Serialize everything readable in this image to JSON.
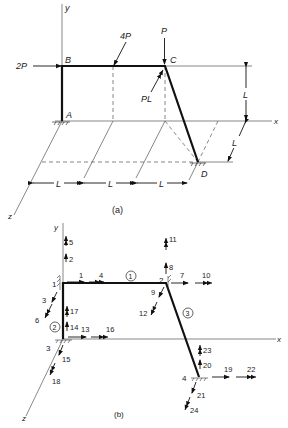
{
  "figure_a": {
    "caption": "(a)",
    "axes": {
      "x": "x",
      "y": "y",
      "z": "z"
    },
    "points": {
      "A": "A",
      "B": "B",
      "C": "C",
      "D": "D"
    },
    "loads": {
      "horizontal_at_B": "2P",
      "inclined_on_BC": "4P",
      "vertical_at_C": "P",
      "moment_at_C": "PL"
    },
    "dimensions": {
      "height": "L",
      "depth": "L",
      "span1": "L",
      "span2": "L",
      "span3": "L"
    }
  },
  "figure_b": {
    "caption": "(b)",
    "axes": {
      "x": "x",
      "y": "y",
      "z": "z"
    },
    "nodes": [
      "1",
      "2",
      "3",
      "4"
    ],
    "members": [
      "1",
      "2",
      "3"
    ],
    "dofs": {
      "n1": [
        "1",
        "2",
        "3",
        "4",
        "5",
        "6"
      ],
      "n2": [
        "7",
        "8",
        "9",
        "10",
        "11",
        "12"
      ],
      "n3": [
        "13",
        "14",
        "15",
        "16",
        "17",
        "18"
      ],
      "n4": [
        "19",
        "20",
        "21",
        "22",
        "23",
        "24"
      ]
    }
  }
}
